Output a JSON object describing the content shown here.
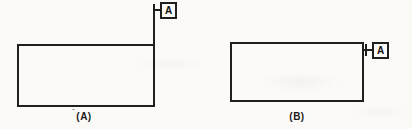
{
  "figure": {
    "panels": [
      {
        "caption": "(A)",
        "datum_label": "A"
      },
      {
        "caption": "(B)",
        "datum_label": "A"
      }
    ],
    "stray_mark": "´"
  },
  "colors": {
    "ink": "#1f1f1f",
    "paper": "#fbfaf7"
  }
}
